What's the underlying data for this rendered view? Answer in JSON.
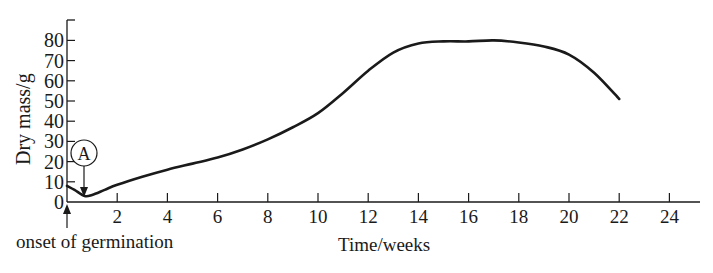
{
  "chart_data": {
    "type": "line",
    "title": "",
    "xlabel": "Time/weeks",
    "ylabel": "Dry mass/g",
    "xlim": [
      0,
      25
    ],
    "ylim": [
      0,
      90
    ],
    "x_ticks": [
      2,
      4,
      6,
      8,
      10,
      12,
      14,
      16,
      18,
      20,
      22,
      24
    ],
    "y_ticks": [
      0,
      10,
      20,
      30,
      40,
      50,
      60,
      70,
      80
    ],
    "grid": false,
    "legend": null,
    "series": [
      {
        "name": "Dry mass",
        "x": [
          0,
          0.3,
          0.7,
          1,
          1.5,
          2,
          3,
          4,
          5,
          6,
          7,
          8,
          9,
          10,
          11,
          12,
          13,
          14,
          15,
          16,
          17,
          18,
          19,
          20,
          21,
          22
        ],
        "y": [
          8,
          6,
          3,
          3.5,
          6,
          8.5,
          12.5,
          16,
          19,
          22,
          26,
          31,
          37,
          44,
          54,
          65,
          74,
          78.5,
          79.5,
          79.5,
          80,
          79,
          77,
          73,
          64,
          51
        ]
      }
    ],
    "annotations": [
      {
        "label": "A",
        "x": 0.7,
        "y": 3,
        "style": "circled label with arrow pointing to minimum"
      },
      {
        "label": "onset of germination",
        "x": 0,
        "style": "upward arrow below x-axis at origin"
      }
    ]
  },
  "labels": {
    "ylabel": "Dry mass/g",
    "xlabel": "Time/weeks",
    "annotation_a": "A",
    "onset": "onset of germination",
    "y0": "0",
    "y10": "10",
    "y20": "20",
    "y30": "30",
    "y40": "40",
    "y50": "50",
    "y60": "60",
    "y70": "70",
    "y80": "80",
    "x2": "2",
    "x4": "4",
    "x6": "6",
    "x8": "8",
    "x10": "10",
    "x12": "12",
    "x14": "14",
    "x16": "16",
    "x18": "18",
    "x20": "20",
    "x22": "22",
    "x24": "24"
  }
}
